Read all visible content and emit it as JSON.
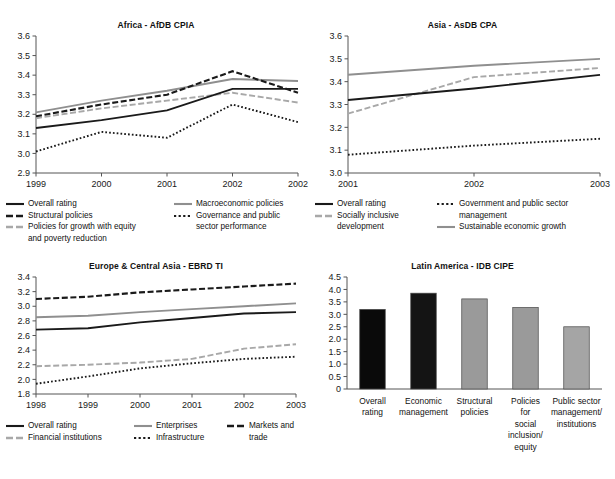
{
  "page": {
    "background": "#ffffff",
    "cut_top_text": "Figure 1  Average country policy and institutional assessment ratings by region"
  },
  "colors": {
    "black": "#1a1a1a",
    "gray": "#8f8f8f",
    "light_gray": "#a8a8a8",
    "axis": "#555555",
    "bar_black": "#0a0a0a",
    "bar_dark": "#141414",
    "bar_gray": "#9a9a9a"
  },
  "chart_data": [
    {
      "id": "africa",
      "type": "line",
      "title": "Africa - AfDB CPIA",
      "xlabel": "",
      "ylabel": "",
      "x": [
        "1999",
        "2000",
        "2001",
        "2002",
        "2002"
      ],
      "ylim": [
        2.9,
        3.6
      ],
      "yticks": [
        "2.9",
        "3.0",
        "3.1",
        "3.2",
        "3.3",
        "3.4",
        "3.5",
        "3.6"
      ],
      "grid": false,
      "legend_position": "bottom",
      "series": [
        {
          "name": "Overall rating",
          "style": "solid-black",
          "values": [
            3.13,
            3.17,
            3.22,
            3.33,
            3.33
          ]
        },
        {
          "name": "Macroeconomic policies",
          "style": "solid-gray",
          "values": [
            3.21,
            3.27,
            3.32,
            3.38,
            3.37
          ]
        },
        {
          "name": "Structural policies",
          "style": "dash-black",
          "values": [
            3.19,
            3.25,
            3.3,
            3.42,
            3.31
          ]
        },
        {
          "name": "Governance and public sector performance",
          "style": "dot-black",
          "values": [
            3.01,
            3.11,
            3.08,
            3.25,
            3.16
          ]
        },
        {
          "name": "Policies for growth with equity and poverty reduction",
          "style": "dash-gray",
          "values": [
            3.18,
            3.23,
            3.27,
            3.31,
            3.26
          ]
        }
      ]
    },
    {
      "id": "asia",
      "type": "line",
      "title": "Asia - AsDB CPA",
      "xlabel": "",
      "ylabel": "",
      "x": [
        "2001",
        "2002",
        "2003"
      ],
      "ylim": [
        3.0,
        3.6
      ],
      "yticks": [
        "3.0",
        "3.1",
        "3.2",
        "3.3",
        "3.4",
        "3.5",
        "3.6"
      ],
      "grid": false,
      "legend_position": "bottom",
      "series": [
        {
          "name": "Overall rating",
          "style": "solid-black",
          "values": [
            3.32,
            3.37,
            3.43
          ]
        },
        {
          "name": "Government and public sector management",
          "style": "dot-black",
          "values": [
            3.08,
            3.12,
            3.15
          ]
        },
        {
          "name": "Socially inclusive development",
          "style": "dash-gray",
          "values": [
            3.26,
            3.42,
            3.46
          ]
        },
        {
          "name": "Sustainable economic growth",
          "style": "solid-gray",
          "values": [
            3.43,
            3.47,
            3.5
          ]
        }
      ]
    },
    {
      "id": "europe",
      "type": "line",
      "title": "Europe & Central Asia - EBRD TI",
      "xlabel": "",
      "ylabel": "",
      "x": [
        "1998",
        "1999",
        "2000",
        "2001",
        "2002",
        "2003"
      ],
      "ylim": [
        1.8,
        3.4
      ],
      "yticks": [
        "1.8",
        "2.0",
        "2.2",
        "2.4",
        "2.6",
        "2.8",
        "3.0",
        "3.2",
        "3.4"
      ],
      "grid": false,
      "legend_position": "bottom",
      "series": [
        {
          "name": "Overall rating",
          "style": "solid-black",
          "values": [
            2.68,
            2.7,
            2.78,
            2.84,
            2.9,
            2.92
          ]
        },
        {
          "name": "Enterprises",
          "style": "solid-gray",
          "values": [
            2.85,
            2.87,
            2.92,
            2.96,
            3.0,
            3.04
          ]
        },
        {
          "name": "Markets and trade",
          "style": "dash-black",
          "values": [
            3.1,
            3.13,
            3.19,
            3.23,
            3.27,
            3.31
          ]
        },
        {
          "name": "Financial institutions",
          "style": "dash-gray",
          "values": [
            2.18,
            2.2,
            2.23,
            2.28,
            2.42,
            2.48
          ]
        },
        {
          "name": "Infrastructure",
          "style": "dot-black",
          "values": [
            1.94,
            2.04,
            2.15,
            2.22,
            2.28,
            2.31
          ]
        }
      ]
    },
    {
      "id": "latin",
      "type": "bar",
      "title": "Latin America - IDB CIPE",
      "xlabel": "",
      "ylabel": "",
      "categories": [
        "Overall\nrating",
        "Economic\nmanagement",
        "Structural\npolicies",
        "Policies\nfor\nsocial\ninclusion/\nequity",
        "Public sector\nmanagement/\ninstitutions"
      ],
      "values": [
        3.2,
        3.85,
        3.62,
        3.28,
        2.5
      ],
      "bar_colors": [
        "#0a0a0a",
        "#141414",
        "#9a9a9a",
        "#9a9a9a",
        "#a5a5a5"
      ],
      "ylim": [
        0,
        4.5
      ],
      "yticks": [
        "0",
        "0.5",
        "1.0",
        "1.5",
        "2.0",
        "2.5",
        "3.0",
        "3.5",
        "4.0",
        "4.5"
      ],
      "grid": false,
      "legend_position": "none"
    }
  ],
  "legends": {
    "africa": {
      "col1": [
        {
          "label": "Overall rating",
          "style": "solid-black"
        },
        {
          "label": "Structural policies",
          "style": "dash-black"
        },
        {
          "label": "Policies for growth with equity\nand poverty reduction",
          "style": "dash-gray"
        }
      ],
      "col2": [
        {
          "label": "Macroeconomic policies",
          "style": "solid-gray"
        },
        {
          "label": "Governance and public\nsector performance",
          "style": "dot-black"
        }
      ]
    },
    "asia": {
      "col1": [
        {
          "label": "Overall rating",
          "style": "solid-black"
        },
        {
          "label": "Socially inclusive\ndevelopment",
          "style": "dash-gray"
        }
      ],
      "col2": [
        {
          "label": "Government and public sector\nmanagement",
          "style": "dot-black"
        },
        {
          "label": "Sustainable economic growth",
          "style": "solid-gray"
        }
      ]
    },
    "europe": {
      "col1": [
        {
          "label": "Overall rating",
          "style": "solid-black"
        },
        {
          "label": "Financial institutions",
          "style": "dash-gray"
        }
      ],
      "col2": [
        {
          "label": "Enterprises",
          "style": "solid-gray"
        },
        {
          "label": "Infrastructure",
          "style": "dot-black"
        }
      ],
      "col3": [
        {
          "label": "Markets and\ntrade",
          "style": "dash-black"
        }
      ]
    }
  }
}
